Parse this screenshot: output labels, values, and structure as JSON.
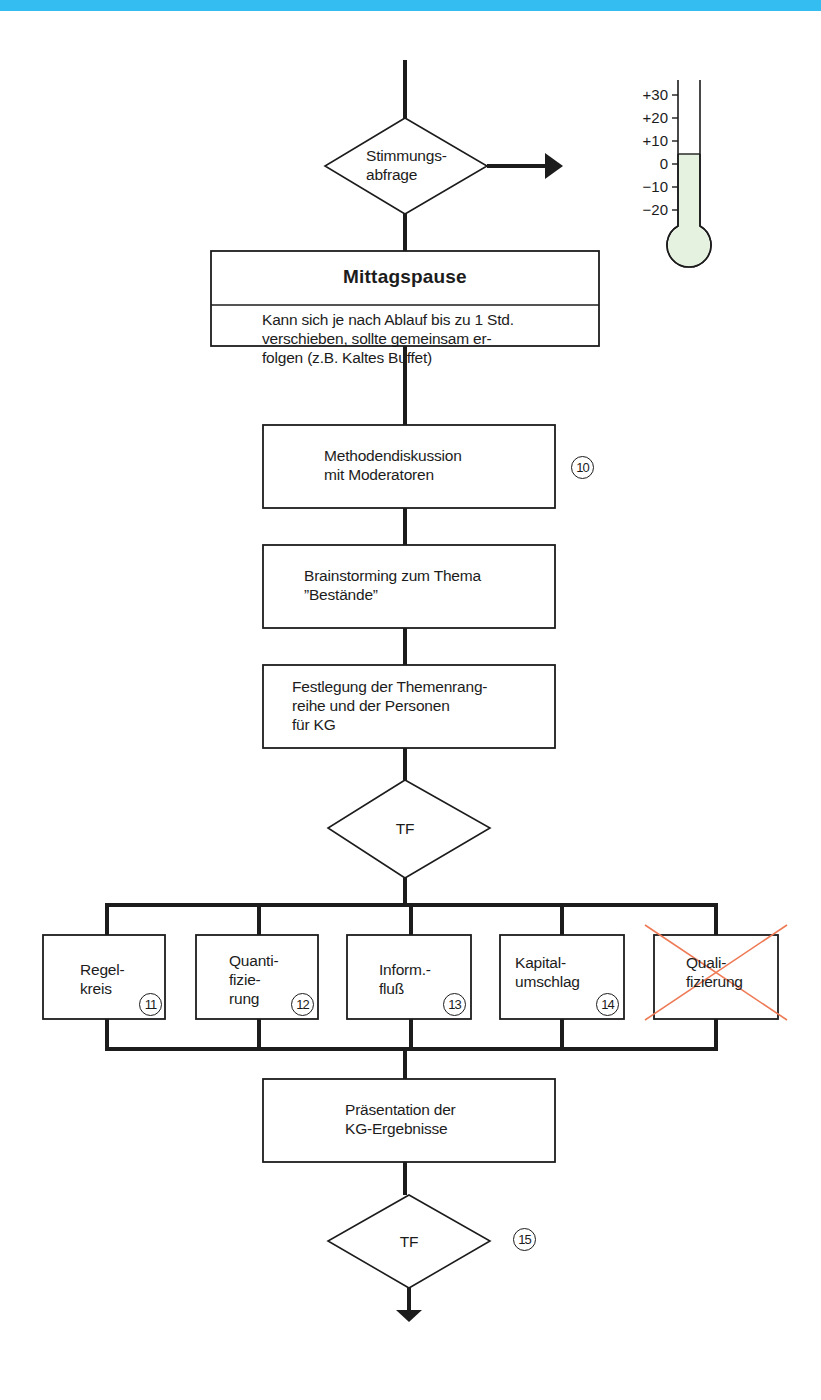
{
  "header": {
    "bar_color": "#33bdf0"
  },
  "decision_mood": {
    "lines": [
      "Stimmungs-",
      "abfrage"
    ]
  },
  "thermometer": {
    "scale": [
      "+30",
      "+20",
      "+10",
      "0",
      "−10",
      "−20"
    ],
    "fill_color": "#e6f2e0",
    "level_value": 5
  },
  "lunch": {
    "title": "Mittagspause",
    "lines": [
      "Kann sich je nach Ablauf bis zu 1 Std.",
      "verschieben, sollte gemeinsam er-",
      "folgen (z.B. Kaltes Buffet)"
    ]
  },
  "method": {
    "lines": [
      "Methodendiskussion",
      "mit Moderatoren"
    ],
    "step": "10"
  },
  "brainstorm": {
    "lines": [
      "Brainstorming zum Thema",
      "”Bestände”"
    ]
  },
  "definition": {
    "lines": [
      "Festlegung der Themenrang-",
      "reihe und der Personen",
      "für KG"
    ]
  },
  "decision_tf1": {
    "label": "TF"
  },
  "groups": [
    {
      "lines": [
        "Regel-",
        "kreis"
      ],
      "step": "11",
      "crossed": false
    },
    {
      "lines": [
        "Quanti-",
        "fizie-",
        "rung"
      ],
      "step": "12",
      "crossed": false
    },
    {
      "lines": [
        "Inform.-",
        "fluß"
      ],
      "step": "13",
      "crossed": false
    },
    {
      "lines": [
        "Kapital-",
        "umschlag"
      ],
      "step": "14",
      "crossed": false
    },
    {
      "lines": [
        "Quali-",
        "fizierung"
      ],
      "step": "",
      "crossed": true
    }
  ],
  "presentation": {
    "lines": [
      "Präsentation der",
      "KG-Ergebnisse"
    ]
  },
  "decision_tf2": {
    "label": "TF",
    "step": "15"
  },
  "colors": {
    "line": "#1c1c1c",
    "cross": "#ee7a55"
  }
}
